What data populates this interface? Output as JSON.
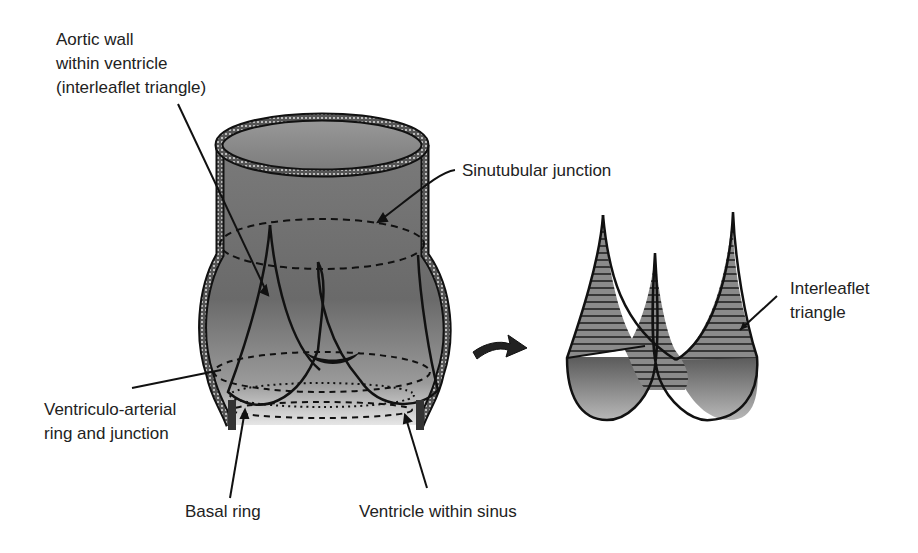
{
  "diagram": {
    "type": "anatomical-illustration",
    "labels": {
      "aortic_wall": "Aortic wall\nwithin ventricle\n(interleaflet triangle)",
      "sinutubular": "Sinutubular junction",
      "ventriculo_arterial": "Ventriculo-arterial\nring and junction",
      "basal_ring": "Basal ring",
      "ventricle_within_sinus": "Ventricle within sinus",
      "interleaflet_triangle": "Interleaflet\ntriangle"
    },
    "colors": {
      "fill_dark": "#6e6e6e",
      "fill_light": "#d8d8d8",
      "outline": "#111111",
      "hatch": "#222222"
    }
  }
}
